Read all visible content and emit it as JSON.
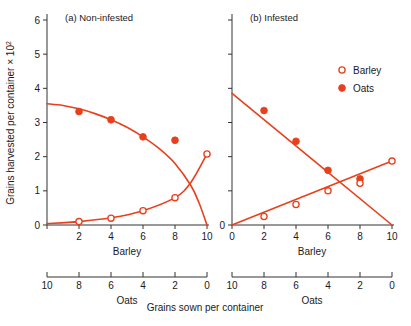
{
  "figure": {
    "bottom_caption": "Grains sown per container",
    "y_axis_label": "Grains harvested per container × 10",
    "y_axis_label_exponent": "2",
    "accent_color": "#E8401C",
    "axis_color": "#333333",
    "marker_fill_open": "#ffffff"
  },
  "legend": {
    "position": "top-right",
    "entries": [
      {
        "label": "Barley",
        "marker": "open-circle-icon"
      },
      {
        "label": "Oats",
        "marker": "filled-circle-icon"
      }
    ]
  },
  "panels": [
    {
      "id": "a",
      "title": "(a)  Non-infested",
      "x_axis_title": "Barley",
      "secondary_axis_title": "Oats",
      "y_ticks": [
        0,
        1,
        2,
        3,
        4,
        5,
        6
      ],
      "y_tick_labels": [
        "0",
        "1",
        "2",
        "3",
        "4",
        "5",
        "6"
      ],
      "x_ticks": [
        0,
        2,
        4,
        6,
        8,
        10
      ],
      "x_tick_labels": [
        "",
        "2",
        "4",
        "6",
        "8",
        "10"
      ],
      "secondary_ticks": [
        10,
        8,
        6,
        4,
        2,
        0
      ],
      "secondary_tick_labels": [
        "10",
        "8",
        "6",
        "4",
        "2",
        "0"
      ]
    },
    {
      "id": "b",
      "title": "(b)  Infested",
      "x_axis_title": "Barley",
      "secondary_axis_title": "Oats",
      "y_ticks": [
        0,
        1,
        2,
        3,
        4,
        5,
        6
      ],
      "y_tick_labels": [
        "0",
        "",
        "",
        "",
        "",
        "",
        ""
      ],
      "x_ticks": [
        0,
        2,
        4,
        6,
        8,
        10
      ],
      "x_tick_labels": [
        "0",
        "2",
        "4",
        "6",
        "8",
        "10"
      ],
      "secondary_ticks": [
        10,
        8,
        6,
        4,
        2,
        0
      ],
      "secondary_tick_labels": [
        "10",
        "8",
        "6",
        "4",
        "2",
        "0"
      ]
    }
  ],
  "chart_data": {
    "type": "line",
    "xlabel": "Barley (grains sown per container)",
    "xlabel_secondary": "Oats (grains sown per container, reversed 10 to 0)",
    "ylabel": "Grains harvested per container × 10^2",
    "xlim": [
      0,
      10
    ],
    "ylim": [
      0,
      6
    ],
    "grid": false,
    "legend_position": "top-right",
    "panels": [
      {
        "panel": "a",
        "panel_title": "(a) Non-infested",
        "series": [
          {
            "name": "Oats",
            "marker": "filled-circle",
            "color": "#E8401C",
            "x": [
              2,
              4,
              6,
              8
            ],
            "values": [
              3.32,
              3.08,
              2.58,
              2.48
            ],
            "fitted_curve_x": [
              0,
              1,
              2,
              3,
              4,
              5,
              6,
              7,
              8,
              9,
              9.5,
              10
            ],
            "fitted_curve_y": [
              3.55,
              3.5,
              3.4,
              3.26,
              3.08,
              2.86,
              2.58,
              2.24,
              1.8,
              1.15,
              0.65,
              0.0
            ]
          },
          {
            "name": "Barley",
            "marker": "open-circle",
            "color": "#E8401C",
            "x": [
              2,
              4,
              6,
              8,
              10
            ],
            "values": [
              0.1,
              0.2,
              0.42,
              0.8,
              2.08
            ],
            "fitted_curve_x": [
              0,
              2,
              4,
              6,
              8,
              9,
              10
            ],
            "fitted_curve_y": [
              0.04,
              0.1,
              0.21,
              0.42,
              0.8,
              1.25,
              2.08
            ]
          }
        ]
      },
      {
        "panel": "b",
        "panel_title": "(b) Infested",
        "series": [
          {
            "name": "Oats",
            "marker": "filled-circle",
            "color": "#E8401C",
            "x": [
              2,
              4,
              6,
              8
            ],
            "values": [
              3.35,
              2.45,
              1.6,
              1.35
            ],
            "fitted_curve_x": [
              0,
              10
            ],
            "fitted_curve_y": [
              3.85,
              0.0
            ]
          },
          {
            "name": "Barley",
            "marker": "open-circle",
            "color": "#E8401C",
            "x": [
              2,
              4,
              6,
              8,
              10
            ],
            "values": [
              0.25,
              0.6,
              1.0,
              1.22,
              1.87
            ],
            "fitted_curve_x": [
              0,
              10
            ],
            "fitted_curve_y": [
              0.0,
              1.87
            ]
          }
        ]
      }
    ]
  }
}
